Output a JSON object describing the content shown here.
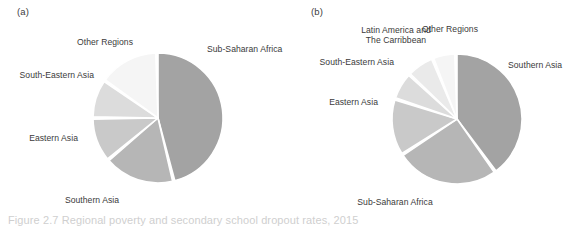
{
  "figure": {
    "panel_a_letter": "(a)",
    "panel_b_letter": "(b)",
    "caption": "Figure 2.7  Regional poverty and secondary school dropout rates, 2015"
  },
  "colors": {
    "tone_1_darkest": "#a3a3a3",
    "tone_2": "#b6b6b6",
    "tone_3": "#c9c9c9",
    "tone_4": "#dcdcdc",
    "tone_5": "#eaeaea",
    "tone_6_lightest": "#f5f5f5",
    "label_text": "#3a3a3a",
    "background": "#ffffff",
    "slice_gap": "#ffffff"
  },
  "chart_data": [
    {
      "id": "panel-a",
      "type": "pie",
      "title": "(a)",
      "xlabel": "",
      "ylabel": "",
      "legend_position": "outside-labels",
      "grid": false,
      "center": [
        158,
        118
      ],
      "radius": 65,
      "start_angle_deg": 0,
      "direction": "clockwise",
      "categories": [
        "Sub-Saharan Africa",
        "Southern Asia",
        "Eastern Asia",
        "South-Eastern Asia",
        "Other Regions"
      ],
      "values": [
        46,
        17,
        10,
        9,
        18
      ],
      "slices": [
        {
          "label": "Sub-Saharan Africa",
          "value": 46,
          "color": "#a3a3a3",
          "start_deg": 0,
          "end_deg": 165
        },
        {
          "label": "Southern Asia",
          "value": 17,
          "color": "#b6b6b6",
          "start_deg": 167,
          "end_deg": 229
        },
        {
          "label": "Eastern Asia",
          "value": 10,
          "color": "#c9c9c9",
          "start_deg": 231,
          "end_deg": 269
        },
        {
          "label": "South-Eastern Asia",
          "value": 9,
          "color": "#dcdcdc",
          "start_deg": 271,
          "end_deg": 304
        },
        {
          "label": "Other Regions",
          "value": 18,
          "color": "#f5f5f5",
          "start_deg": 306,
          "end_deg": 358
        }
      ]
    },
    {
      "id": "panel-b",
      "type": "pie",
      "title": "(b)",
      "xlabel": "",
      "ylabel": "",
      "legend_position": "outside-labels",
      "grid": false,
      "center": [
        457,
        119
      ],
      "radius": 65,
      "start_angle_deg": 0,
      "direction": "clockwise",
      "categories": [
        "Southern Asia",
        "Sub-Saharan Africa",
        "Eastern Asia",
        "South-Eastern Asia",
        "Latin America and The Caribbean",
        "Other Regions"
      ],
      "values": [
        40,
        25,
        13,
        7,
        7,
        5
      ],
      "slices": [
        {
          "label": "Southern Asia",
          "value": 40,
          "color": "#a3a3a3",
          "start_deg": 0,
          "end_deg": 143
        },
        {
          "label": "Sub-Saharan Africa",
          "value": 25,
          "color": "#b6b6b6",
          "start_deg": 145,
          "end_deg": 236
        },
        {
          "label": "Eastern Asia",
          "value": 13,
          "color": "#c9c9c9",
          "start_deg": 238,
          "end_deg": 287
        },
        {
          "label": "South-Eastern Asia",
          "value": 7,
          "color": "#dcdcdc",
          "start_deg": 289,
          "end_deg": 312
        },
        {
          "label": "Latin America and The Caribbean",
          "value": 7,
          "color": "#eaeaea",
          "start_deg": 314,
          "end_deg": 337
        },
        {
          "label": "Other Regions",
          "value": 5,
          "color": "#f5f5f5",
          "start_deg": 339,
          "end_deg": 358
        }
      ]
    }
  ],
  "panel_a_labels": {
    "other_regions": "Other Regions",
    "south_eastern_asia": "South-Eastern Asia",
    "eastern_asia": "Eastern Asia",
    "southern_asia": "Southern Asia",
    "sub_saharan_africa": "Sub-Saharan Africa"
  },
  "panel_b_labels": {
    "latin_america_line1": "Latin America and",
    "latin_america_line2": "The Carribbean",
    "other_regions": "Other Regions",
    "south_eastern_asia": "South-Eastern Asia",
    "eastern_asia": "Eastern Asia",
    "southern_asia": "Southern Asia",
    "sub_saharan_africa": "Sub-Saharan Africa"
  }
}
